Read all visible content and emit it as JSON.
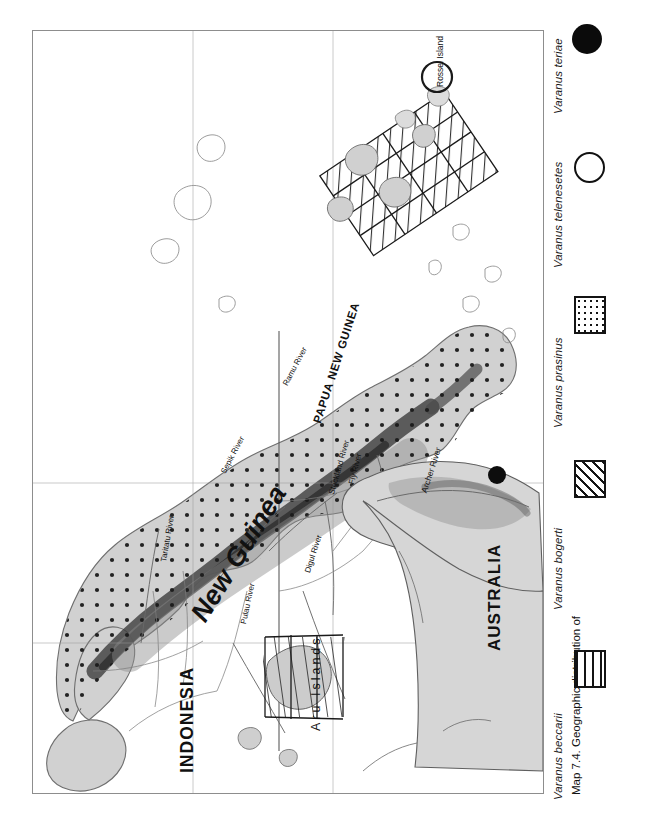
{
  "figure": {
    "caption": "Map 7.4. Geographic distribution of",
    "number": "7.4"
  },
  "legend": {
    "items": [
      {
        "label": "Varanus beccarii",
        "symbol": "vertical-lines-box"
      },
      {
        "label": "Varanus bogerti",
        "symbol": "diagonal-hatch-box"
      },
      {
        "label": "Varanus prasinus",
        "symbol": "dotted-box"
      },
      {
        "label": "Varanus telenesetes",
        "symbol": "open-circle"
      },
      {
        "label": "Varanus teriae",
        "symbol": "filled-circle"
      }
    ]
  },
  "map": {
    "countries": [
      {
        "name": "INDONESIA"
      },
      {
        "name": "PAPUA NEW GUINEA"
      },
      {
        "name": "AUSTRALIA"
      }
    ],
    "islands": [
      {
        "name": "New Guinea"
      },
      {
        "name": "Aru Islands"
      },
      {
        "name": "Rossel Island"
      }
    ],
    "rivers": [
      {
        "name": "Taritatu River"
      },
      {
        "name": "Sepik River"
      },
      {
        "name": "Ramu River"
      },
      {
        "name": "Strickland River"
      },
      {
        "name": "Fly River"
      },
      {
        "name": "Digul River"
      },
      {
        "name": "Pulau River"
      },
      {
        "name": "Archer River"
      }
    ]
  },
  "colors": {
    "land": "#d9d9d9",
    "highland": "#9a9a9a",
    "mountain": "#5e5e5e",
    "frame": "#8d8d8d",
    "ink": "#141414",
    "paper": "#ffffff"
  }
}
